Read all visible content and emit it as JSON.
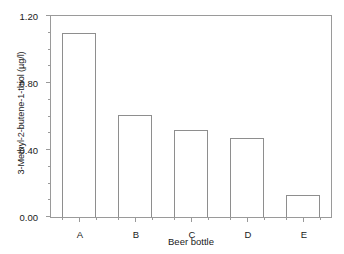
{
  "chart_data": {
    "type": "bar",
    "title": "",
    "xlabel": "Beer bottle",
    "ylabel": "3-Methyl-2-butene-1-thiol (µg/l)",
    "categories": [
      "A",
      "B",
      "C",
      "D",
      "E"
    ],
    "values": [
      1.1,
      0.61,
      0.52,
      0.47,
      0.13
    ],
    "ylim": [
      0.0,
      1.2
    ],
    "ytick_labels": [
      "0.00",
      "0.40",
      "0.80",
      "1.20"
    ],
    "ytick_values": [
      0.0,
      0.4,
      0.8,
      1.2
    ],
    "ytick_minor_values": [
      0.1,
      0.2,
      0.3,
      0.5,
      0.6,
      0.7,
      0.9,
      1.0,
      1.1
    ],
    "grid": false,
    "legend": null,
    "series": [
      {
        "name": "3-Methyl-2-butene-1-thiol",
        "values": [
          1.1,
          0.61,
          0.52,
          0.47,
          0.13
        ]
      }
    ],
    "bar_face_color": "#ffffff",
    "bar_edge_color": "#8e8e8e",
    "axis_color": "#9a9a9a",
    "background_color": "#ffffff"
  }
}
